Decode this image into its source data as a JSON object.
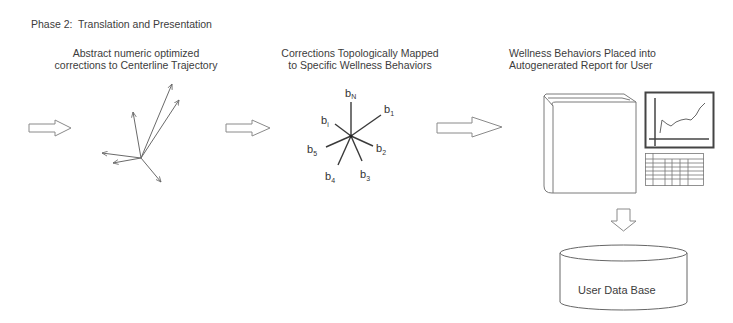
{
  "title": "Phase 2:  Translation and Presentation",
  "stages": [
    {
      "id": "abstract-corrections",
      "caption": [
        "Abstract numeric optimized",
        "corrections to Centerline Trajectory"
      ],
      "graphic": "vector-bundle"
    },
    {
      "id": "topological-mapping",
      "caption": [
        "Corrections Topologically Mapped",
        "to Specific Wellness Behaviors"
      ],
      "graphic": "behavior-star",
      "labels": {
        "top": "b",
        "top_sub": "N",
        "upper_right": "b",
        "upper_right_sub": "1",
        "upper_left": "b",
        "upper_left_sub": "i",
        "right": "b",
        "right_sub": "2",
        "lower_right": "b",
        "lower_right_sub": "3",
        "lower_left": "b",
        "lower_left_sub": "4",
        "left": "b",
        "left_sub": "5"
      }
    },
    {
      "id": "report",
      "caption": [
        "Wellness Behaviors Placed into",
        "Autogenerated Report for User"
      ],
      "graphic": "report-book-chart-table"
    }
  ],
  "database": {
    "label": "User Data Base"
  },
  "connectors": [
    "arrow-right",
    "arrow-right",
    "arrow-right",
    "arrow-down"
  ]
}
